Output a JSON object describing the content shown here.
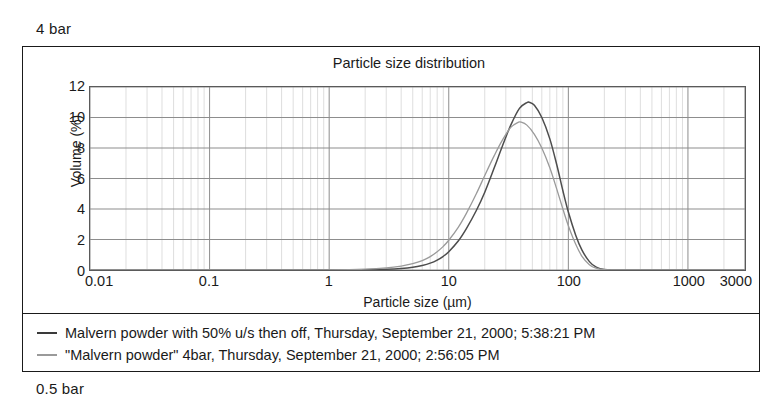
{
  "captions": {
    "top": "4 bar",
    "bottom": "0.5 bar"
  },
  "chart_data": {
    "type": "line",
    "title": "Particle size distribution",
    "xlabel": "Particle size (µm)",
    "ylabel": "Volume (%)",
    "xscale": "log",
    "xlim": [
      0.01,
      3000
    ],
    "ylim": [
      0,
      12
    ],
    "grid": true,
    "legend_position": "below-plot",
    "xticks": [
      {
        "value": 0.01,
        "label": "0.01"
      },
      {
        "value": 0.1,
        "label": "0.1"
      },
      {
        "value": 1,
        "label": "1"
      },
      {
        "value": 10,
        "label": "10"
      },
      {
        "value": 100,
        "label": "100"
      },
      {
        "value": 1000,
        "label": "1000"
      },
      {
        "value": 3000,
        "label": "3000"
      }
    ],
    "yticks": [
      {
        "value": 0,
        "label": "0"
      },
      {
        "value": 2,
        "label": "2"
      },
      {
        "value": 4,
        "label": "4"
      },
      {
        "value": 6,
        "label": "6"
      },
      {
        "value": 8,
        "label": "8"
      },
      {
        "value": 10,
        "label": "10"
      },
      {
        "value": 12,
        "label": "12"
      }
    ],
    "series": [
      {
        "name": "Malvern powder with 50% u/s then off, Thursday, September 21, 2000; 5:38:21 PM",
        "color": "#4d4d4d",
        "peak_x": 47,
        "peak_y": 11.0,
        "x": [
          0.01,
          0.1,
          0.5,
          1,
          2,
          3,
          4,
          5,
          6,
          7,
          8,
          9,
          10,
          12,
          14,
          17,
          20,
          24,
          28,
          33,
          39,
          45,
          47,
          52,
          60,
          70,
          80,
          90,
          100,
          115,
          130,
          150,
          170,
          200,
          300,
          1000,
          3000
        ],
        "y": [
          0,
          0,
          0,
          0,
          0.02,
          0.05,
          0.1,
          0.18,
          0.3,
          0.45,
          0.65,
          0.9,
          1.2,
          1.9,
          2.7,
          3.9,
          5.1,
          6.7,
          8.1,
          9.5,
          10.6,
          10.98,
          11.0,
          10.8,
          10.0,
          8.6,
          6.9,
          5.2,
          3.8,
          2.3,
          1.3,
          0.55,
          0.2,
          0.04,
          0,
          0,
          0
        ]
      },
      {
        "name": "\"Malvern powder\" 4bar, Thursday, September 21, 2000; 2:56:05 PM",
        "color": "#9a9a9a",
        "peak_x": 40,
        "peak_y": 9.7,
        "x": [
          0.01,
          0.1,
          0.5,
          1,
          2,
          3,
          4,
          5,
          6,
          7,
          8,
          9,
          10,
          12,
          14,
          17,
          20,
          24,
          28,
          33,
          38,
          40,
          45,
          52,
          60,
          70,
          80,
          90,
          100,
          115,
          130,
          150,
          170,
          200,
          300,
          1000,
          3000
        ],
        "y": [
          0,
          0,
          0,
          0.01,
          0.06,
          0.14,
          0.26,
          0.42,
          0.62,
          0.88,
          1.2,
          1.55,
          1.95,
          2.8,
          3.7,
          5.0,
          6.2,
          7.5,
          8.5,
          9.35,
          9.68,
          9.7,
          9.5,
          8.9,
          8.0,
          6.7,
          5.3,
          4.0,
          2.9,
          1.7,
          0.9,
          0.35,
          0.12,
          0.02,
          0,
          0,
          0
        ]
      }
    ]
  },
  "legend": {
    "entries": [
      {
        "label": "Malvern powder with 50% u/s then off, Thursday, September 21, 2000; 5:38:21 PM",
        "color": "#3a3a3a"
      },
      {
        "label": "\"Malvern powder\" 4bar, Thursday, September 21, 2000; 2:56:05 PM",
        "color": "#9a9a9a"
      }
    ]
  }
}
